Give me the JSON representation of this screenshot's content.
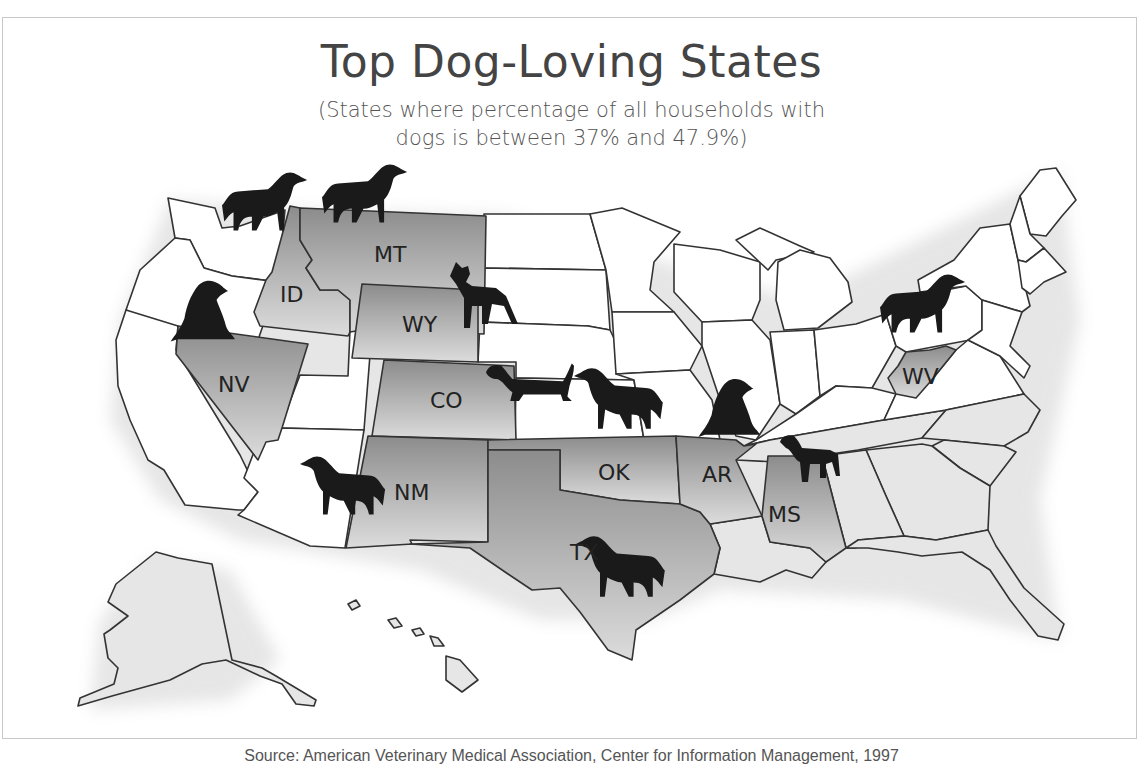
{
  "title": "Top Dog-Loving States",
  "subtitle_line1": "(States where percentage of all households with",
  "subtitle_line2": "dogs is between 37% and 47.9%)",
  "source": "Source: American Veterinary Medical Association, Center for Information Management, 1997",
  "colors": {
    "highlight_dark": "#8c8c8c",
    "highlight_light": "#dcdcdc",
    "plain_west": "#ffffff",
    "plain_east": "#e6e6e6",
    "border": "#333333",
    "dog": "#1a1a1a"
  },
  "highlighted_states": [
    {
      "abbr": "ID",
      "name": "Idaho"
    },
    {
      "abbr": "MT",
      "name": "Montana"
    },
    {
      "abbr": "WY",
      "name": "Wyoming"
    },
    {
      "abbr": "NV",
      "name": "Nevada"
    },
    {
      "abbr": "CO",
      "name": "Colorado"
    },
    {
      "abbr": "NM",
      "name": "New Mexico"
    },
    {
      "abbr": "OK",
      "name": "Oklahoma"
    },
    {
      "abbr": "TX",
      "name": "Texas"
    },
    {
      "abbr": "AR",
      "name": "Arkansas"
    },
    {
      "abbr": "MS",
      "name": "Mississippi"
    },
    {
      "abbr": "WV",
      "name": "West Virginia"
    }
  ],
  "labels": {
    "ID": "ID",
    "MT": "MT",
    "WY": "WY",
    "NV": "NV",
    "CO": "CO",
    "NM": "NM",
    "OK": "OK",
    "TX": "TX",
    "AR": "AR",
    "MS": "MS",
    "WV": "WV"
  },
  "dog_icons": [
    {
      "near": "WA/ID",
      "pose": "standing"
    },
    {
      "near": "MT",
      "pose": "standing"
    },
    {
      "near": "WY",
      "pose": "standing-boxer"
    },
    {
      "near": "NV",
      "pose": "sitting"
    },
    {
      "near": "CO/KS",
      "pose": "dachshund"
    },
    {
      "near": "OK/KS",
      "pose": "standing"
    },
    {
      "near": "AR",
      "pose": "sitting"
    },
    {
      "near": "MS",
      "pose": "standing-small"
    },
    {
      "near": "NM",
      "pose": "standing"
    },
    {
      "near": "TX",
      "pose": "standing-shepherd"
    },
    {
      "near": "WV",
      "pose": "standing"
    }
  ]
}
